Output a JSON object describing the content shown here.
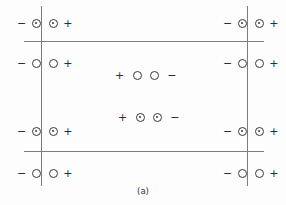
{
  "figure": {
    "caption": "(a)",
    "background_color": "#fdfdfd",
    "line_color": "#7d7d7d",
    "symbol_color": "#3a3a3a",
    "width": 286,
    "height": 205
  },
  "lines": {
    "horizontal": [
      {
        "name": "upper-horizontal-line",
        "y": 41,
        "x_start": 24,
        "x_end": 264
      },
      {
        "name": "lower-horizontal-line",
        "y": 151,
        "x_start": 24,
        "x_end": 264
      }
    ],
    "vertical": [
      {
        "name": "left-vertical-line",
        "x": 41,
        "y_start": 6,
        "y_end": 186
      },
      {
        "name": "right-vertical-line",
        "x": 247,
        "y_start": 6,
        "y_end": 186
      }
    ]
  },
  "charge_groups": [
    {
      "id": "top-left",
      "side": "left",
      "row": 1,
      "x": 17,
      "y": 16,
      "left_sign": "−",
      "right_sign": "+",
      "circle_type": "dotted",
      "straddles_line": true,
      "label": "negative-dotted-circle dotted-circle-positive"
    },
    {
      "id": "top-right",
      "side": "right",
      "row": 1,
      "x": 223,
      "y": 16,
      "left_sign": "−",
      "right_sign": "+",
      "circle_type": "dotted",
      "straddles_line": true,
      "label": "negative-dotted-circle dotted-circle-positive"
    },
    {
      "id": "second-left",
      "side": "left",
      "row": 2,
      "x": 17,
      "y": 56,
      "left_sign": "−",
      "right_sign": "+",
      "circle_type": "plain",
      "straddles_line": true,
      "label": "negative-open-circle open-circle-positive"
    },
    {
      "id": "second-right",
      "side": "right",
      "row": 2,
      "x": 223,
      "y": 56,
      "left_sign": "−",
      "right_sign": "+",
      "circle_type": "plain",
      "straddles_line": true,
      "label": "negative-open-circle open-circle-positive"
    },
    {
      "id": "third-left",
      "side": "left",
      "row": 3,
      "x": 17,
      "y": 124,
      "left_sign": "−",
      "right_sign": "+",
      "circle_type": "dotted",
      "straddles_line": true,
      "label": "negative-dotted-circle dotted-circle-positive"
    },
    {
      "id": "third-right",
      "side": "right",
      "row": 3,
      "x": 223,
      "y": 124,
      "left_sign": "−",
      "right_sign": "+",
      "circle_type": "dotted",
      "straddles_line": true,
      "label": "negative-dotted-circle dotted-circle-positive"
    },
    {
      "id": "bottom-left",
      "side": "left",
      "row": 4,
      "x": 17,
      "y": 166,
      "left_sign": "−",
      "right_sign": "+",
      "circle_type": "plain",
      "straddles_line": true,
      "label": "negative-open-circle open-circle-positive"
    },
    {
      "id": "bottom-right",
      "side": "right",
      "row": 4,
      "x": 223,
      "y": 166,
      "left_sign": "−",
      "right_sign": "+",
      "circle_type": "plain",
      "straddles_line": true,
      "label": "negative-open-circle open-circle-positive"
    }
  ],
  "center_groups": [
    {
      "id": "center-upper",
      "x": 115,
      "y": 68,
      "left_sign": "+",
      "right_sign": "−",
      "circle_type": "plain",
      "label": "positive-open-circle open-circle-negative"
    },
    {
      "id": "center-lower",
      "x": 118,
      "y": 110,
      "left_sign": "+",
      "right_sign": "−",
      "circle_type": "dotted",
      "label": "positive-dotted-circle dotted-circle-negative"
    }
  ]
}
